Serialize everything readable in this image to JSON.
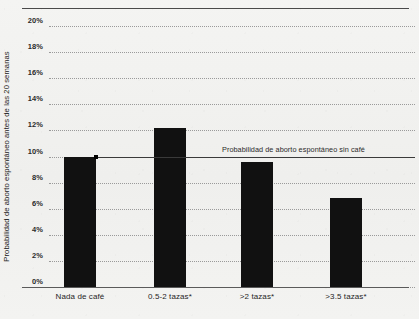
{
  "chart_data": {
    "type": "bar",
    "title": "",
    "subtitle": "",
    "xlabel": "",
    "ylabel": "Probabilidad de aborto espontáneo antes de las 20 semanas",
    "categories": [
      "Nada de café",
      "0.5-2 tazas*",
      ">2 tazas*",
      ">3.5 tazas*"
    ],
    "values": [
      10.0,
      12.2,
      9.6,
      6.8
    ],
    "ylim": [
      0,
      20
    ],
    "ytick_labels": [
      "20%",
      "18%",
      "16%",
      "14%",
      "12%",
      "10%",
      "8%",
      "6%",
      "4%",
      "2%",
      "0%"
    ],
    "ytick_values": [
      20,
      18,
      16,
      14,
      12,
      10,
      8,
      6,
      4,
      2,
      0
    ],
    "grid": true,
    "grid_style": "dotted",
    "legend": false,
    "bar_color": "#111111",
    "annotations": [
      {
        "text": "Probabilidad de aborto espontáneo sin café",
        "value": 10.0,
        "type": "reference-line"
      }
    ]
  },
  "colors": {
    "background": "#f2f2f0",
    "bar": "#111111",
    "grid": "#9a9a9a",
    "axis": "#5a5a5a",
    "text": "#1f1f1f"
  }
}
